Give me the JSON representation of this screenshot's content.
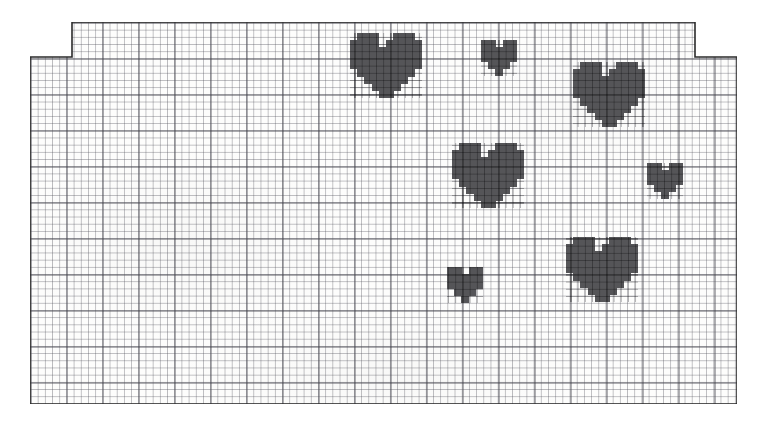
{
  "scene": {
    "title": "Graph paper sheet with hand-drawn pixel hearts",
    "background_color": "#ffffff",
    "paper_color": "#fdfdfc",
    "ink_color": "#2b2b2b",
    "heart_color": "#555558"
  },
  "paper": {
    "name": "graph-paper-sheet",
    "left": 30,
    "top": 22,
    "width": 707,
    "height": 382,
    "notch": {
      "description": "top-left and top-right corners are stepped down; the centre band of the top edge is raised",
      "left_step_width": 42,
      "right_step_width": 42,
      "step_height": 35
    },
    "grid": {
      "fine_cell_px": 7.2,
      "bold_every_cells": 5,
      "bold_cell_px": 36,
      "fine_line_color": "#50505a",
      "bold_line_color": "#282832"
    }
  },
  "hearts": [
    {
      "id": "heart-top-left-large",
      "label": "large heart upper-left-of-centre",
      "x": 350,
      "y": 33,
      "cell": 7.2,
      "size": "large",
      "pattern": [
        "0111001110",
        "1111011111",
        "1111111111",
        "1111111111",
        "1111111111",
        "0111111110",
        "0011111100",
        "0001111000",
        "0000110000"
      ]
    },
    {
      "id": "heart-top-middle-small",
      "label": "small heart top centre",
      "x": 481,
      "y": 40,
      "cell": 7.2,
      "size": "small",
      "pattern": [
        "11011",
        "11111",
        "11111",
        "01110",
        "00100"
      ]
    },
    {
      "id": "heart-top-right-large",
      "label": "large heart upper-right",
      "x": 573,
      "y": 62,
      "cell": 7.2,
      "size": "large",
      "pattern": [
        "0111001110",
        "1111011111",
        "1111111111",
        "1111111111",
        "1111111111",
        "0111111110",
        "0011111100",
        "0001111000",
        "0000110000"
      ]
    },
    {
      "id": "heart-middle-centre",
      "label": "medium heart centre",
      "x": 452,
      "y": 143,
      "cell": 7.2,
      "size": "medium",
      "pattern": [
        "0111001110",
        "1111011111",
        "1111111111",
        "1111111111",
        "1111111111",
        "0111111110",
        "0011111100",
        "0001111000",
        "0000110000"
      ]
    },
    {
      "id": "heart-right-small",
      "label": "small heart right edge",
      "x": 647,
      "y": 163,
      "cell": 7.2,
      "size": "small",
      "pattern": [
        "11011",
        "11111",
        "11111",
        "01110",
        "00100"
      ]
    },
    {
      "id": "heart-bottom-left-small",
      "label": "small heart lower centre",
      "x": 447,
      "y": 267,
      "cell": 7.2,
      "size": "small",
      "pattern": [
        "11011",
        "11111",
        "11111",
        "01110",
        "00100"
      ]
    },
    {
      "id": "heart-bottom-right-large",
      "label": "large heart lower-right",
      "x": 566,
      "y": 237,
      "cell": 7.2,
      "size": "large",
      "pattern": [
        "0111001110",
        "1111011111",
        "1111111111",
        "1111111111",
        "1111111111",
        "0111111110",
        "0011111100",
        "0001111000",
        "0000110000"
      ]
    }
  ]
}
